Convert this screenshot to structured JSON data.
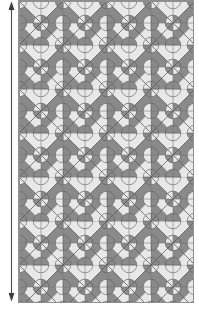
{
  "figure": {
    "kind": "tiling-pattern-swatch",
    "caption": "",
    "colors": {
      "dark": "#8a8a8a",
      "light": "#e8e8e8",
      "line": "#5a5a5a",
      "outline": "#8f8f8f",
      "arrow": "#3a3a3a",
      "background": "#ffffff"
    }
  },
  "dimension_arrow": {
    "name": "height-dimension-arrow",
    "orientation": "vertical",
    "double_headed": true,
    "label": "",
    "x": 11,
    "y_top": 3,
    "y_bottom": 300
  },
  "pattern": {
    "name": "pinwheel-clover-tiling",
    "cell_size": 22,
    "columns": 8,
    "rows": 14,
    "origin_x": 18,
    "origin_y": 0,
    "width": 176,
    "height": 303,
    "motifs": [
      "checkerboard",
      "diagonal-pinwheel",
      "four-petal-clover"
    ],
    "description": "Alternating light and dark square grid overlaid with diagonals forming pinwheels and four-petal clover rosettes at alternating lattice points."
  }
}
